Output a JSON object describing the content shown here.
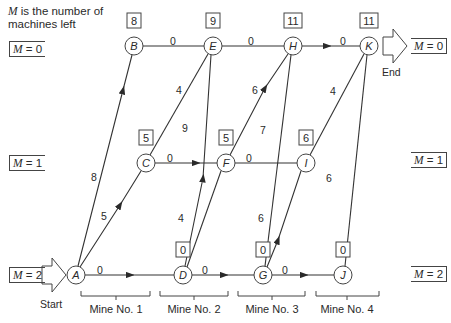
{
  "note": {
    "var": "M",
    "text": " is the number of machines left"
  },
  "state_labels_left": [
    {
      "text": "M = 0",
      "var": "M",
      "value": "= 0"
    },
    {
      "text": "M = 1",
      "var": "M",
      "value": "= 1"
    },
    {
      "text": "M = 2",
      "var": "M",
      "value": "= 2"
    }
  ],
  "state_labels_right": [
    {
      "text": "M = 0",
      "var": "M",
      "value": "= 0"
    },
    {
      "text": "M = 1",
      "var": "M",
      "value": "= 1"
    },
    {
      "text": "M = 2",
      "var": "M",
      "value": "= 2"
    }
  ],
  "start_label": "Start",
  "end_label": "End",
  "nodes": [
    {
      "id": "A",
      "x": 76,
      "y": 275,
      "value": null
    },
    {
      "id": "B",
      "x": 134,
      "y": 46,
      "value": "8"
    },
    {
      "id": "C",
      "x": 146,
      "y": 163,
      "value": "5"
    },
    {
      "id": "D",
      "x": 183,
      "y": 275,
      "value": "0"
    },
    {
      "id": "E",
      "x": 213,
      "y": 46,
      "value": "9"
    },
    {
      "id": "F",
      "x": 226,
      "y": 163,
      "value": "5"
    },
    {
      "id": "G",
      "x": 263,
      "y": 275,
      "value": "0"
    },
    {
      "id": "H",
      "x": 293,
      "y": 46,
      "value": "11"
    },
    {
      "id": "I",
      "x": 306,
      "y": 163,
      "value": "6"
    },
    {
      "id": "J",
      "x": 343,
      "y": 275,
      "value": "0"
    },
    {
      "id": "K",
      "x": 369,
      "y": 46,
      "value": "11"
    }
  ],
  "edges": [
    {
      "from": "A",
      "to": "D",
      "weight": "0"
    },
    {
      "from": "D",
      "to": "G",
      "weight": "0"
    },
    {
      "from": "G",
      "to": "J",
      "weight": "0"
    },
    {
      "from": "C",
      "to": "F",
      "weight": "0"
    },
    {
      "from": "F",
      "to": "I",
      "weight": "0"
    },
    {
      "from": "B",
      "to": "E",
      "weight": "0"
    },
    {
      "from": "E",
      "to": "H",
      "weight": "0"
    },
    {
      "from": "H",
      "to": "K",
      "weight": "0"
    },
    {
      "from": "A",
      "to": "B",
      "weight": "8"
    },
    {
      "from": "A",
      "to": "C",
      "weight": "5"
    },
    {
      "from": "C",
      "to": "E",
      "weight": "4"
    },
    {
      "from": "D",
      "to": "E",
      "weight": "9"
    },
    {
      "from": "D",
      "to": "F",
      "weight": "4"
    },
    {
      "from": "F",
      "to": "H",
      "weight": "6"
    },
    {
      "from": "G",
      "to": "H",
      "weight": "7"
    },
    {
      "from": "G",
      "to": "I",
      "weight": "6"
    },
    {
      "from": "I",
      "to": "K",
      "weight": "4"
    },
    {
      "from": "J",
      "to": "K",
      "weight": "6"
    }
  ],
  "mines": [
    "Mine No. 1",
    "Mine No. 2",
    "Mine No. 3",
    "Mine No. 4"
  ]
}
